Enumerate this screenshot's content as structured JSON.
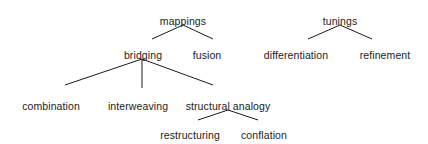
{
  "diagram": {
    "type": "tree",
    "title": "",
    "background_color": "#ffffff",
    "text_color": "#1b1b1b",
    "edge_color": "#1b1b1b",
    "roots": [
      "mappings",
      "tunings"
    ],
    "nodes": [
      {
        "id": "mappings",
        "label": "mappings",
        "x": 183,
        "y": 15,
        "level": 0,
        "parent": null
      },
      {
        "id": "bridging",
        "label": "bridging",
        "x": 143,
        "y": 49,
        "level": 1,
        "parent": "mappings"
      },
      {
        "id": "fusion",
        "label": "fusion",
        "x": 207,
        "y": 49,
        "level": 1,
        "parent": "mappings"
      },
      {
        "id": "combination",
        "label": "combination",
        "x": 51,
        "y": 100,
        "level": 2,
        "parent": "bridging"
      },
      {
        "id": "interweaving",
        "label": "interweaving",
        "x": 138,
        "y": 100,
        "level": 2,
        "parent": "bridging"
      },
      {
        "id": "structural-analogy",
        "label": "structural analogy",
        "x": 228,
        "y": 100,
        "level": 2,
        "parent": "bridging"
      },
      {
        "id": "restructuring",
        "label": "restructuring",
        "x": 190,
        "y": 129,
        "level": 3,
        "parent": "structural-analogy"
      },
      {
        "id": "conflation",
        "label": "conflation",
        "x": 264,
        "y": 129,
        "level": 3,
        "parent": "structural-analogy"
      },
      {
        "id": "tunings",
        "label": "tunings",
        "x": 340,
        "y": 15,
        "level": 0,
        "parent": null
      },
      {
        "id": "differentiation",
        "label": "differentiation",
        "x": 296,
        "y": 49,
        "level": 1,
        "parent": "tunings"
      },
      {
        "id": "refinement",
        "label": "refinement",
        "x": 385,
        "y": 49,
        "level": 1,
        "parent": "tunings"
      }
    ],
    "edges": [
      {
        "id": "edge-mappings-bridging",
        "from": "mappings",
        "to": "bridging",
        "x1": 183,
        "y1": 25,
        "x2": 152,
        "y2": 39
      },
      {
        "id": "edge-mappings-fusion",
        "from": "mappings",
        "to": "fusion",
        "x1": 183,
        "y1": 25,
        "x2": 213,
        "y2": 39
      },
      {
        "id": "edge-bridging-combination",
        "from": "bridging",
        "to": "combination",
        "x1": 142,
        "y1": 59,
        "x2": 65,
        "y2": 85
      },
      {
        "id": "edge-bridging-interweaving",
        "from": "bridging",
        "to": "interweaving",
        "x1": 142,
        "y1": 59,
        "x2": 142,
        "y2": 88
      },
      {
        "id": "edge-bridging-structural-analogy",
        "from": "bridging",
        "to": "structural-analogy",
        "x1": 142,
        "y1": 59,
        "x2": 213,
        "y2": 85
      },
      {
        "id": "edge-structural-restructuring",
        "from": "structural-analogy",
        "to": "restructuring",
        "x1": 228,
        "y1": 110,
        "x2": 198,
        "y2": 120
      },
      {
        "id": "edge-structural-conflation",
        "from": "structural-analogy",
        "to": "conflation",
        "x1": 228,
        "y1": 110,
        "x2": 258,
        "y2": 120
      },
      {
        "id": "edge-tunings-differentiation",
        "from": "tunings",
        "to": "differentiation",
        "x1": 340,
        "y1": 25,
        "x2": 308,
        "y2": 39
      },
      {
        "id": "edge-tunings-refinement",
        "from": "tunings",
        "to": "refinement",
        "x1": 340,
        "y1": 25,
        "x2": 372,
        "y2": 39
      }
    ]
  }
}
